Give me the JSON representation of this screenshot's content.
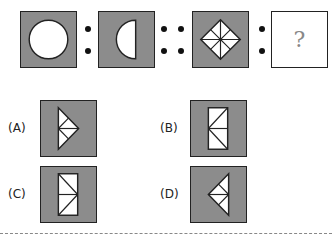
{
  "question": {
    "analogy": [
      {
        "id": "figure-1",
        "shape": "circle"
      },
      {
        "id": "figure-2",
        "shape": "half-circle-left"
      },
      {
        "id": "figure-3",
        "shape": "diamond-8-segments"
      },
      {
        "id": "figure-4",
        "shape": "unknown",
        "text": "?"
      }
    ],
    "separators": [
      ":",
      "::",
      ":"
    ]
  },
  "options": [
    {
      "label": "(A)",
      "shape": "triangle-right-pointing-subdivided"
    },
    {
      "label": "(B)",
      "shape": "rectangle-with-left-vertex-lines"
    },
    {
      "label": "(C)",
      "shape": "rectangle-with-right-vertex-lines"
    },
    {
      "label": "(D)",
      "shape": "triangle-left-pointing-subdivided"
    }
  ],
  "colors": {
    "box_fill": "#8c8c8c",
    "shape_fill": "#ffffff",
    "stroke": "#222222"
  }
}
